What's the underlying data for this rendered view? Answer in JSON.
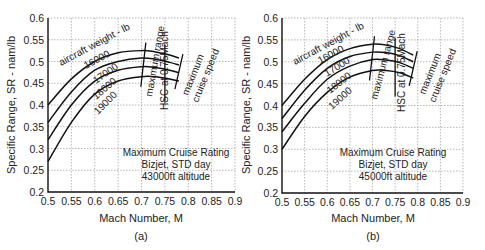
{
  "chart_data": [
    {
      "type": "line",
      "panel_label": "(a)",
      "title": "",
      "xlabel": "Mach Number, M",
      "ylabel": "Specific Range, SR - nam/lb",
      "xlim": [
        0.5,
        0.9
      ],
      "ylim": [
        0.2,
        0.6
      ],
      "xticks": [
        "0.5",
        "0.55",
        "0.6",
        "0.65",
        "0.7",
        "0.75",
        "0.8",
        "0.85",
        "0.9"
      ],
      "yticks": [
        "0.2",
        "0.25",
        "0.3",
        "0.35",
        "0.4",
        "0.45",
        "0.5",
        "0.55",
        "0.6"
      ],
      "grid": true,
      "legend_title": "aircraft weight - lb",
      "series": [
        {
          "name": "16000",
          "x": [
            0.5,
            0.55,
            0.6,
            0.65,
            0.7,
            0.73,
            0.76,
            0.78
          ],
          "y": [
            0.4,
            0.46,
            0.5,
            0.52,
            0.525,
            0.522,
            0.515,
            0.508
          ]
        },
        {
          "name": "17000",
          "x": [
            0.5,
            0.55,
            0.6,
            0.65,
            0.7,
            0.73,
            0.76,
            0.78
          ],
          "y": [
            0.36,
            0.43,
            0.48,
            0.5,
            0.508,
            0.505,
            0.498,
            0.492
          ]
        },
        {
          "name": "18000",
          "x": [
            0.5,
            0.55,
            0.6,
            0.65,
            0.7,
            0.73,
            0.76,
            0.78
          ],
          "y": [
            0.32,
            0.4,
            0.455,
            0.48,
            0.488,
            0.486,
            0.48,
            0.474
          ]
        },
        {
          "name": "19000",
          "x": [
            0.5,
            0.55,
            0.6,
            0.65,
            0.7,
            0.73,
            0.76,
            0.78
          ],
          "y": [
            0.27,
            0.36,
            0.425,
            0.455,
            0.465,
            0.465,
            0.46,
            0.455
          ]
        }
      ],
      "annotations": [
        {
          "text": "maximum range",
          "x": 0.705
        },
        {
          "text": "HSC at 0.75Mach",
          "x": 0.75
        },
        {
          "text": "maximum cruise speed",
          "x": 0.78
        },
        {
          "text": "Maximum Cruise Rating"
        },
        {
          "text": "Bizjet, STD day"
        },
        {
          "text": "43000ft altitude"
        }
      ]
    },
    {
      "type": "line",
      "panel_label": "(b)",
      "title": "",
      "xlabel": "Mach Number, M",
      "ylabel": "Specific Range, SR - nam/lb",
      "xlim": [
        0.5,
        0.9
      ],
      "ylim": [
        0.2,
        0.6
      ],
      "xticks": [
        "0.5",
        "0.55",
        "0.6",
        "0.65",
        "0.7",
        "0.75",
        "0.8",
        "0.85",
        "0.9"
      ],
      "yticks": [
        "0.2",
        "0.25",
        "0.3",
        "0.35",
        "0.4",
        "0.45",
        "0.5",
        "0.55",
        "0.6"
      ],
      "grid": true,
      "legend_title": "aircraft weight - lb",
      "series": [
        {
          "name": "16000",
          "x": [
            0.5,
            0.55,
            0.6,
            0.65,
            0.7,
            0.73,
            0.76,
            0.79
          ],
          "y": [
            0.4,
            0.46,
            0.505,
            0.53,
            0.54,
            0.538,
            0.53,
            0.515
          ]
        },
        {
          "name": "17000",
          "x": [
            0.5,
            0.55,
            0.6,
            0.65,
            0.7,
            0.73,
            0.76,
            0.79
          ],
          "y": [
            0.37,
            0.435,
            0.485,
            0.512,
            0.522,
            0.521,
            0.514,
            0.5
          ]
        },
        {
          "name": "18000",
          "x": [
            0.5,
            0.55,
            0.6,
            0.65,
            0.7,
            0.73,
            0.76,
            0.79
          ],
          "y": [
            0.34,
            0.405,
            0.46,
            0.49,
            0.505,
            0.504,
            0.498,
            0.485
          ]
        },
        {
          "name": "19000",
          "x": [
            0.5,
            0.55,
            0.6,
            0.65,
            0.7,
            0.73,
            0.76,
            0.79
          ],
          "y": [
            0.3,
            0.375,
            0.43,
            0.465,
            0.48,
            0.48,
            0.475,
            0.463
          ]
        }
      ],
      "annotations": [
        {
          "text": "maximum range",
          "x": 0.7
        },
        {
          "text": "HSC at 0.75Mach",
          "x": 0.75
        },
        {
          "text": "maximum cruise speed",
          "x": 0.79
        },
        {
          "text": "Maximum Cruise Rating"
        },
        {
          "text": "Bizjet, STD day"
        },
        {
          "text": "45000ft altitude"
        }
      ]
    }
  ],
  "panels": [
    {
      "label": "(a)",
      "xlabel": "Mach Number, M",
      "ylabel": "Specific Range, SR - nam/lb",
      "legend_title": "aircraft weight - lb",
      "max_range_label": "maximum range",
      "hsc_label": "HSC at 0.75Mach",
      "max_cruise_label_1": "maximum",
      "max_cruise_label_2": "cruise speed",
      "info_1": "Maximum Cruise Rating",
      "info_2": "Bizjet, STD day",
      "info_3": "43000ft altitude"
    },
    {
      "label": "(b)",
      "xlabel": "Mach Number, M",
      "ylabel": "Specific Range, SR - nam/lb",
      "legend_title": "aircraft weight - lb",
      "max_range_label": "maximum range",
      "hsc_label": "HSC at 0.75Mach",
      "max_cruise_label_1": "maximum",
      "max_cruise_label_2": "cruise speed",
      "info_1": "Maximum Cruise Rating",
      "info_2": "Bizjet, STD day",
      "info_3": "45000ft altitude"
    }
  ]
}
